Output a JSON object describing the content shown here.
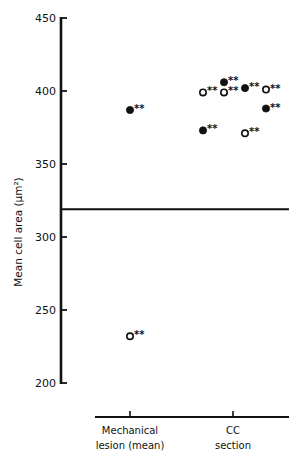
{
  "chart_data": {
    "type": "scatter",
    "title": "",
    "xlabel": "",
    "ylabel": "Mean cell area (μm²)",
    "ylim": [
      200,
      450
    ],
    "yticks": [
      200,
      250,
      300,
      350,
      400,
      450
    ],
    "grid": false,
    "legend": null,
    "categories": [
      "Mechanical lesion (mean)",
      "CC section"
    ],
    "category_lines": [
      [
        "Mechanical",
        "lesion (mean)"
      ],
      [
        "CC",
        "section"
      ]
    ],
    "reference_line": {
      "value": 319,
      "description": "horizontal control mean line"
    },
    "series": [
      {
        "name": "filled",
        "marker": "filled-circle",
        "points": [
          {
            "category": "Mechanical lesion (mean)",
            "x_offset": 0,
            "y": 387,
            "annotation": "**"
          },
          {
            "category": "CC section",
            "x_offset": -1,
            "y": 373,
            "annotation": "**"
          },
          {
            "category": "CC section",
            "x_offset": 0,
            "y": 406,
            "annotation": "**"
          },
          {
            "category": "CC section",
            "x_offset": 1,
            "y": 402,
            "annotation": "**"
          },
          {
            "category": "CC section",
            "x_offset": 2,
            "y": 388,
            "annotation": "**"
          }
        ]
      },
      {
        "name": "open",
        "marker": "open-circle",
        "points": [
          {
            "category": "Mechanical lesion (mean)",
            "x_offset": 0,
            "y": 232,
            "annotation": "**"
          },
          {
            "category": "CC section",
            "x_offset": -1,
            "y": 399,
            "annotation": "**"
          },
          {
            "category": "CC section",
            "x_offset": 0,
            "y": 399,
            "annotation": "**"
          },
          {
            "category": "CC section",
            "x_offset": 1,
            "y": 371,
            "annotation": "**"
          },
          {
            "category": "CC section",
            "x_offset": 2,
            "y": 401,
            "annotation": "**"
          }
        ]
      }
    ]
  }
}
